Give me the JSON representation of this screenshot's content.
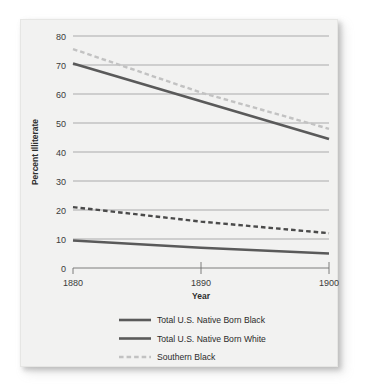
{
  "figure": {
    "panel_background": "#f2f2f1",
    "page_background": "#ffffff"
  },
  "chart_data": {
    "type": "line",
    "title": "",
    "xlabel": "Year",
    "ylabel": "Percent Illiterate",
    "x": [
      1880,
      1890,
      1900
    ],
    "xticklabels": [
      "1880",
      "1890",
      "1900"
    ],
    "xlim": [
      1880,
      1900
    ],
    "ylim": [
      0,
      80
    ],
    "yticks": [
      0,
      10,
      20,
      30,
      40,
      50,
      60,
      70,
      80
    ],
    "yticklabels": [
      "0",
      "10",
      "20",
      "30",
      "40",
      "50",
      "60",
      "70",
      "80"
    ],
    "grid": "horizontal",
    "legend_position": "below-axes",
    "series": [
      {
        "name": "Total U.S. Native Born Black",
        "values": [
          70.5,
          57.5,
          44.5
        ],
        "color": "#5a5a5a",
        "style": "solid",
        "width": 2.6
      },
      {
        "name": "Total U.S. Native Born White",
        "values": [
          9.5,
          7.0,
          5.0
        ],
        "color": "#5a5a5a",
        "style": "solid",
        "width": 2.6
      },
      {
        "name": "Southern Black",
        "values": [
          75.5,
          60.5,
          48.0
        ],
        "color": "#c2c2c2",
        "style": "dashed",
        "width": 2.4
      },
      {
        "name": "Southern White",
        "values": [
          21.0,
          16.0,
          12.0
        ],
        "color": "#4a4a4a",
        "style": "dashed",
        "width": 2.4
      }
    ]
  },
  "legend": {
    "items": [
      {
        "label": "Total U.S. Native Born Black",
        "swatch": "solid-gray-line"
      },
      {
        "label": "Total U.S. Native Born White",
        "swatch": "solid-gray-line"
      },
      {
        "label": "Southern Black",
        "swatch": "dashed-light-gray-line"
      },
      {
        "label": "Southern White",
        "swatch": "dashed-dark-gray-line"
      }
    ]
  },
  "axes": {
    "y_title": "Percent Illiterate",
    "x_title": "Year",
    "y_labels": [
      "80",
      "70",
      "60",
      "50",
      "40",
      "30",
      "20",
      "10",
      "0"
    ],
    "x_labels": [
      "1880",
      "1890",
      "1900"
    ]
  }
}
